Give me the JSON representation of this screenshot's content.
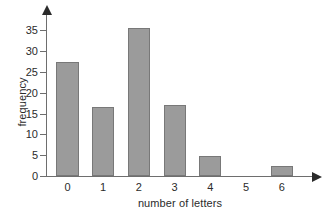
{
  "chart_data": {
    "type": "bar",
    "title": "",
    "xlabel": "number of letters",
    "ylabel": "frequency",
    "categories": [
      "0",
      "1",
      "2",
      "3",
      "4",
      "5",
      "6"
    ],
    "values": [
      27.3,
      16.6,
      35.6,
      17.1,
      4.7,
      0,
      2.3
    ],
    "series": [
      {
        "name": "frequency",
        "values": [
          27.3,
          16.6,
          35.6,
          17.1,
          4.7,
          0,
          2.3
        ]
      }
    ],
    "xlim": [
      -0.6,
      6.9
    ],
    "ylim": [
      0,
      37.5
    ],
    "y_ticks": [
      0,
      5,
      10,
      15,
      20,
      25,
      30,
      35
    ],
    "y_tick_labels": [
      "0",
      "5",
      "10",
      "15",
      "20",
      "25",
      "30",
      "35"
    ],
    "x_tick_labels": [
      "0",
      "1",
      "2",
      "3",
      "4",
      "5",
      "6"
    ],
    "grid": false,
    "legend": null,
    "legend_position": "none",
    "bar_color": "#9b9b9b",
    "bar_edge_color": "#787878",
    "axis_color": "#6e6e6e",
    "text_color": "#2b2b2b",
    "background": "#ffffff",
    "axis_arrows": true,
    "annotations": []
  }
}
